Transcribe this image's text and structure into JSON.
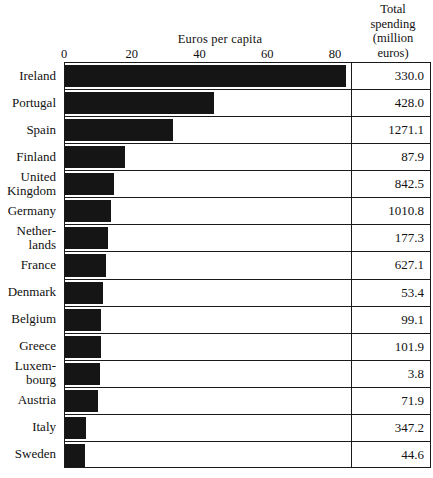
{
  "chart_data": {
    "type": "bar",
    "orientation": "horizontal",
    "title": "",
    "xlabel": "Euros per capita",
    "ylabel": "",
    "xlim": [
      0,
      85
    ],
    "xticks": [
      0,
      20,
      40,
      60,
      80
    ],
    "xtick_labels": [
      "0",
      "20",
      "40",
      "60",
      "80"
    ],
    "grid": false,
    "legend": null,
    "categories": [
      "Ireland",
      "Portugal",
      "Spain",
      "Finland",
      "United\nKingdom",
      "Germany",
      "Nether-\nlands",
      "France",
      "Denmark",
      "Belgium",
      "Greece",
      "Luxem-\nbourg",
      "Austria",
      "Italy",
      "Sweden"
    ],
    "values": [
      83.7,
      44.4,
      32.2,
      17.8,
      14.5,
      13.6,
      12.7,
      12.3,
      11.2,
      10.7,
      10.6,
      10.4,
      9.8,
      6.2,
      5.9
    ],
    "extra_column": {
      "header": [
        "Total",
        "spending",
        "(million",
        "euros)"
      ],
      "header_text": "Total spending (million euros)",
      "values": [
        "330.0",
        "428.0",
        "1271.1",
        "87.9",
        "842.5",
        "1010.8",
        "177.3",
        "627.1",
        "53.4",
        "99.1",
        "101.9",
        "3.8",
        "71.9",
        "347.2",
        "44.6"
      ]
    }
  },
  "colors": {
    "bar": "#151515",
    "border": "#1a1a1a",
    "background": "#ffffff",
    "text": "#111111"
  }
}
